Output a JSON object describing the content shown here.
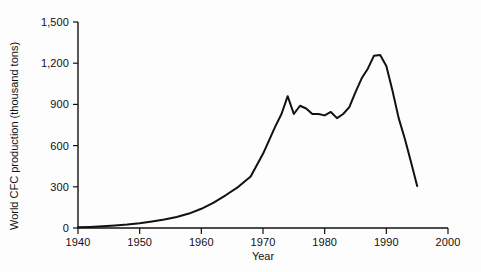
{
  "chart_data": {
    "type": "line",
    "title": "",
    "xlabel": "Year",
    "ylabel": "World CFC production (thousand tons)",
    "xlim": [
      1940,
      2000
    ],
    "ylim": [
      0,
      1500
    ],
    "xticks": [
      "1940",
      "1950",
      "1960",
      "1970",
      "1980",
      "1990",
      "2000"
    ],
    "xtick_values": [
      1940,
      1950,
      1960,
      1970,
      1980,
      1990,
      2000
    ],
    "yticks": [
      "0",
      "300",
      "600",
      "900",
      "1,200",
      "1,500"
    ],
    "ytick_values": [
      0,
      300,
      600,
      900,
      1200,
      1500
    ],
    "grid": false,
    "legend": null,
    "line_color": "#111111",
    "line_width": 2,
    "series": [
      {
        "name": "World CFC production",
        "x": [
          1940,
          1942,
          1944,
          1946,
          1948,
          1950,
          1952,
          1954,
          1956,
          1958,
          1960,
          1962,
          1964,
          1966,
          1968,
          1970,
          1971,
          1972,
          1973,
          1974,
          1975,
          1976,
          1977,
          1978,
          1979,
          1980,
          1981,
          1982,
          1983,
          1984,
          1985,
          1986,
          1987,
          1988,
          1989,
          1990,
          1991,
          1992,
          1993,
          1994,
          1995
        ],
        "values": [
          5,
          8,
          12,
          18,
          25,
          35,
          48,
          62,
          80,
          105,
          140,
          185,
          240,
          300,
          375,
          540,
          640,
          740,
          830,
          960,
          830,
          890,
          870,
          830,
          830,
          820,
          845,
          800,
          830,
          880,
          990,
          1090,
          1160,
          1255,
          1260,
          1180,
          1000,
          800,
          650,
          480,
          305
        ]
      }
    ]
  },
  "axis": {
    "y_title": "World CFC production (thousand tons)",
    "x_title": "Year"
  }
}
